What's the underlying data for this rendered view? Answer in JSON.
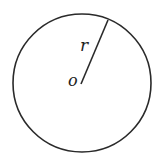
{
  "diagram": {
    "type": "circle-with-radius",
    "circle": {
      "center": [
        82,
        83
      ],
      "radius": 69,
      "stroke": "#2a2a2a",
      "stroke_width": 1.6
    },
    "radius_line": {
      "from": [
        81,
        84
      ],
      "to": [
        108,
        20
      ],
      "stroke": "#2a2a2a",
      "stroke_width": 1.6
    },
    "labels": {
      "radius": "r",
      "center": "o"
    }
  }
}
